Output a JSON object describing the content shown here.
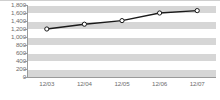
{
  "chart_data": {
    "type": "line",
    "title": "",
    "subtitle": "",
    "xlabel": "",
    "ylabel": "",
    "categories": [
      "12/03",
      "12/04",
      "12/05",
      "12/06",
      "12/07"
    ],
    "values": [
      1200,
      1320,
      1410,
      1600,
      1660
    ],
    "series": [
      {
        "name": "",
        "values": [
          1200,
          1320,
          1410,
          1600,
          1660
        ]
      }
    ],
    "ylim": [
      0,
      1800
    ],
    "ytick_step": 200,
    "ytick_labels": [
      "1,800",
      "1,600",
      "1,400",
      "1,200",
      "1,000",
      "800",
      "600",
      "400",
      "200",
      "0"
    ],
    "ytick_values": [
      1800,
      1600,
      1400,
      1200,
      1000,
      800,
      600,
      400,
      200,
      0
    ],
    "grid": true,
    "grid_style": "banded-horizontal",
    "legend": false,
    "legend_position": "none",
    "marker": "circle-open",
    "colors": {
      "line": "#1a1a1a",
      "marker_fill": "#ffffff",
      "marker_stroke": "#1a1a1a",
      "band": "#d6d6d6",
      "gridline": "#ffffff",
      "axis": "#9a9a9a",
      "tick_text": "#6d6d6d",
      "plot_background": "#ffffff"
    }
  }
}
